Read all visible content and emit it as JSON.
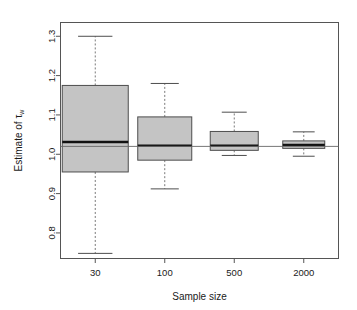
{
  "figure": {
    "type": "boxplot-figure",
    "background": "#ffffff",
    "frame_color": "#555555",
    "box_fill": "#c4c4c4",
    "box_border": "#4d4d4d",
    "median_color": "#111111",
    "whisker_color": "#7a7a7a",
    "reference_line_color": "#666666"
  },
  "axes": {
    "y_title": "Estimate of τ",
    "y_title_sub": "w",
    "x_title": "Sample size",
    "y_ticks": [
      "0.8",
      "0.9",
      "1.0",
      "1.1",
      "1.2",
      "1.3"
    ],
    "x_ticks": [
      "30",
      "100",
      "500",
      "2000"
    ]
  },
  "chart_data": {
    "type": "box",
    "title": "",
    "xlabel": "Sample size",
    "ylabel": "Estimate of τ_w",
    "categories": [
      "30",
      "100",
      "500",
      "2000"
    ],
    "ylim": [
      0.735,
      1.335
    ],
    "yticks": [
      0.8,
      0.9,
      1.0,
      1.1,
      1.2,
      1.3
    ],
    "grid": false,
    "legend": null,
    "reference_line": {
      "orientation": "horizontal",
      "value": 1.02,
      "label": ""
    },
    "boxes": [
      {
        "category": "30",
        "whisker_low": 0.748,
        "q1": 0.955,
        "median": 1.031,
        "q3": 1.175,
        "whisker_high": 1.3
      },
      {
        "category": "100",
        "whisker_low": 0.912,
        "q1": 0.985,
        "median": 1.022,
        "q3": 1.095,
        "whisker_high": 1.18
      },
      {
        "category": "500",
        "whisker_low": 0.997,
        "q1": 1.01,
        "median": 1.022,
        "q3": 1.058,
        "whisker_high": 1.107
      },
      {
        "category": "2000",
        "whisker_low": 0.995,
        "q1": 1.015,
        "median": 1.024,
        "q3": 1.034,
        "whisker_high": 1.057
      }
    ]
  }
}
